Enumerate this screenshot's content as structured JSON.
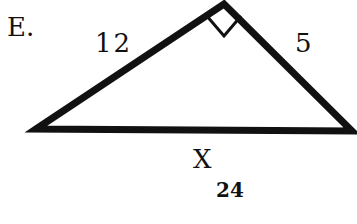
{
  "problem": {
    "label": "E.",
    "answer": "24"
  },
  "triangle": {
    "type": "right-triangle",
    "vertices": {
      "left": [
        36,
        129
      ],
      "apex": [
        224,
        2
      ],
      "right": [
        354,
        132
      ]
    },
    "right_angle_at": "apex",
    "sides": {
      "left_leg": "12",
      "right_leg": "5",
      "base": "X"
    },
    "stroke_color": "#111111",
    "stroke_width": 7
  }
}
